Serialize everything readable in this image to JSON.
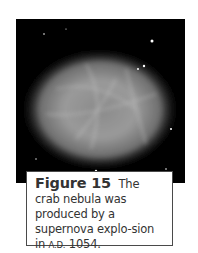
{
  "figure": {
    "label": "Figure 15",
    "caption_pre": "The crab nebula was produced by a supernova explo-sion in",
    "caption_era": "A.D.",
    "caption_post": " 1054.",
    "image_subject": "crab-nebula-photo"
  }
}
